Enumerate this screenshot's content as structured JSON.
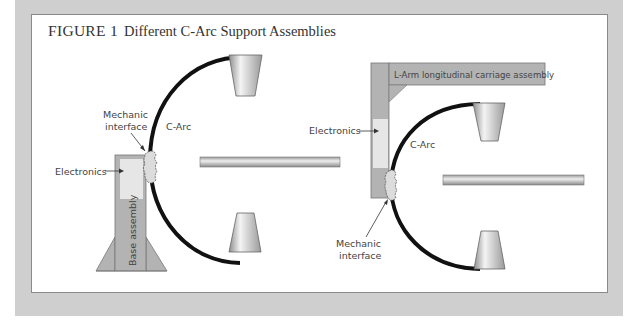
{
  "figure": {
    "number": "FIGURE 1",
    "title": "Different C-Arc Support Assemblies"
  },
  "left_diagram": {
    "labels": {
      "mechanic_interface_line1": "Mechanic",
      "mechanic_interface_line2": "interface",
      "c_arc": "C-Arc",
      "electronics": "Electronics",
      "base_assembly": "Base assembly"
    }
  },
  "right_diagram": {
    "labels": {
      "l_arm": "L-Arm longitudinal carriage assembly",
      "electronics": "Electronics",
      "c_arc": "C-Arc",
      "mechanic_interface_line1": "Mechanic",
      "mechanic_interface_line2": "interface"
    }
  },
  "colors": {
    "frame": "#cfcfcf",
    "assembly_fill": "#b3b3b3",
    "electronics_fill": "#e6e6e6",
    "arc": "#111111"
  }
}
